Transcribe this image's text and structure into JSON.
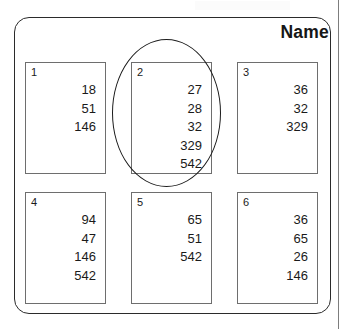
{
  "figure": {
    "title": "Name",
    "highlighted_cell_index": "2"
  },
  "cells": [
    {
      "index": "1",
      "values": [
        "18",
        "51",
        "146"
      ]
    },
    {
      "index": "2",
      "values": [
        "27",
        "28",
        "32",
        "329",
        "542"
      ]
    },
    {
      "index": "3",
      "values": [
        "36",
        "32",
        "329"
      ]
    },
    {
      "index": "4",
      "values": [
        "94",
        "47",
        "146",
        "542"
      ]
    },
    {
      "index": "5",
      "values": [
        "65",
        "51",
        "542"
      ]
    },
    {
      "index": "6",
      "values": [
        "36",
        "65",
        "26",
        "146"
      ]
    }
  ]
}
